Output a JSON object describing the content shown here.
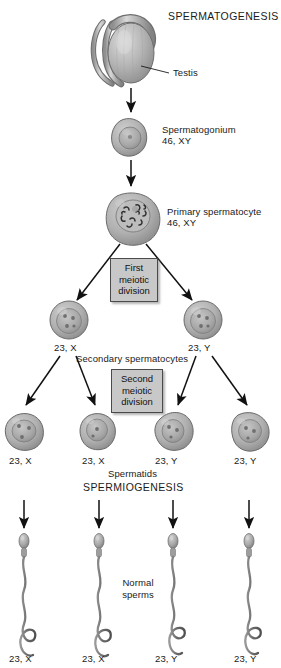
{
  "diagram": {
    "title": "SPERMATOGENESIS",
    "subtitle": "SPERMIOGENESIS",
    "width": 281,
    "height": 668
  },
  "labels": {
    "testis": "Testis",
    "spermatogonium_name": "Spermatogonium",
    "spermatogonium_karyotype": "46, XY",
    "primary_spermatocyte_name": "Primary spermatocyte",
    "primary_spermatocyte_karyotype": "46, XY",
    "secondary_spermatocytes": "Secondary spermatocytes",
    "spermatids": "Spermatids",
    "normal_sperms_line1": "Normal",
    "normal_sperms_line2": "sperms"
  },
  "division_boxes": [
    {
      "line1": "First",
      "line2": "meiotic",
      "line3": "division"
    },
    {
      "line1": "Second",
      "line2": "meiotic",
      "line3": "division"
    }
  ],
  "secondary_spermatocyte_labels": [
    "23, X",
    "23, Y"
  ],
  "spermatid_labels": [
    "23, X",
    "23, X",
    "23, Y",
    "23, Y"
  ],
  "sperm_labels": [
    "23, X",
    "23, X",
    "23, Y",
    "23, Y"
  ],
  "colors": {
    "cell_fill": "#a9a9a9",
    "cell_fill_light": "#c4c4c4",
    "nucleus": "#9a9a9a",
    "outline": "#5a5a5a",
    "arrow": "#111111",
    "box_fill": "#c8c8c8",
    "text": "#1a1a1a",
    "background": "#ffffff"
  }
}
